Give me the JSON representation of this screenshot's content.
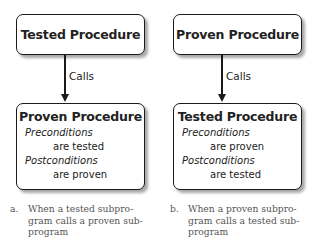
{
  "diagrams": [
    {
      "top_box": {
        "title": "Tested Procedure"
      },
      "edge_label": "Calls",
      "bottom_box": {
        "title": "Proven Procedure",
        "preconditions_label": "Preconditions",
        "preconditions_value": "are tested",
        "postconditions_label": "Postconditions",
        "postconditions_value": "are proven"
      },
      "caption": {
        "letter": "a.",
        "text": "When a tested subpro-gram calls a proven sub-program"
      }
    },
    {
      "top_box": {
        "title": "Proven Procedure"
      },
      "edge_label": "Calls",
      "bottom_box": {
        "title": "Tested Procedure",
        "preconditions_label": "Preconditions",
        "preconditions_value": "are proven",
        "postconditions_label": "Postconditions",
        "postconditions_value": "are tested"
      },
      "caption": {
        "letter": "b.",
        "text": "When a proven subpro-gram calls a tested sub-program"
      }
    }
  ]
}
